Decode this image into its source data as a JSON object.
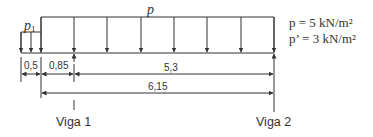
{
  "diagram": {
    "load_labels": {
      "p": "p",
      "p1_base": "p",
      "p1_sub": "1"
    },
    "legend": [
      {
        "text": "p  = 5 kN/m²"
      },
      {
        "text": "p’ = 3 kN/m²"
      }
    ],
    "dimensions": {
      "d1": "0,5",
      "d2": "0,85",
      "d3": "5,3",
      "d4": "6,15"
    },
    "supports": {
      "viga1": "Viga 1",
      "viga2": "Viga 2"
    },
    "color": "#333333"
  }
}
